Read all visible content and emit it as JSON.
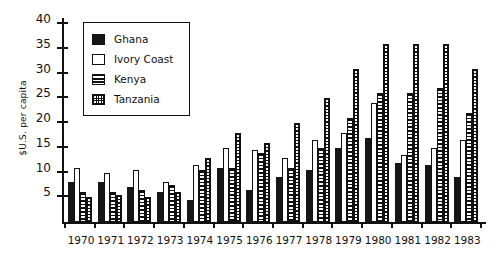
{
  "chart_data": {
    "type": "bar",
    "title": "",
    "xlabel": "",
    "ylabel": "$U.S. per capita",
    "ylim": [
      0,
      40
    ],
    "yticks": [
      5,
      10,
      15,
      20,
      25,
      30,
      35,
      40
    ],
    "grid": false,
    "legend_position": "top-left-inside",
    "categories": [
      "1970",
      "1971",
      "1972",
      "1973",
      "1974",
      "1975",
      "1976",
      "1977",
      "1978",
      "1979",
      "1980",
      "1981",
      "1982",
      "1983"
    ],
    "series": [
      {
        "name": "Ghana",
        "color": "#161616",
        "pattern": "solid-black",
        "values": [
          8,
          8,
          7,
          6,
          4.5,
          11,
          6.5,
          9,
          10.5,
          15,
          17,
          12,
          11.5,
          9
        ]
      },
      {
        "name": "Ivory Coast",
        "color": "#ffffff",
        "pattern": "open-white",
        "values": [
          11,
          10,
          10.5,
          8,
          11.5,
          15,
          14.5,
          13,
          16.5,
          18,
          24,
          13.5,
          15,
          16.5
        ]
      },
      {
        "name": "Kenya",
        "color": "#ffffff",
        "pattern": "horizontal-lines",
        "values": [
          6,
          6,
          6.5,
          7.5,
          10.5,
          11,
          14,
          11,
          15,
          21,
          26,
          26,
          27,
          22
        ]
      },
      {
        "name": "Tanzania",
        "color": "#ffffff",
        "pattern": "dotted-grid",
        "values": [
          5,
          5.5,
          5,
          6,
          13,
          18,
          16,
          20,
          25,
          31,
          36,
          36,
          36,
          31
        ]
      }
    ]
  },
  "legend": {
    "items": [
      {
        "label": "Ghana",
        "swatch": "solid-black-swatch"
      },
      {
        "label": "Ivory Coast",
        "swatch": "open-white-swatch"
      },
      {
        "label": "Kenya",
        "swatch": "horizontal-lines-swatch"
      },
      {
        "label": "Tanzania",
        "swatch": "dotted-grid-swatch"
      }
    ]
  }
}
